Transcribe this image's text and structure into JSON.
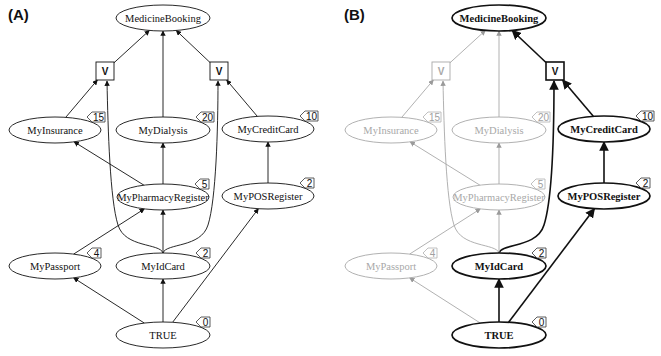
{
  "figure": {
    "panels": [
      {
        "label": "(A)",
        "highlight": []
      },
      {
        "label": "(B)",
        "highlight": [
          "MedicineBooking",
          "OR2",
          "MyCreditCard",
          "MyPOSRegister",
          "MyIdCard",
          "TRUE"
        ]
      }
    ],
    "nodes": [
      {
        "id": "MedicineBooking",
        "label": "MedicineBooking",
        "type": "ellipse",
        "cost": null
      },
      {
        "id": "OR1",
        "label": "V",
        "type": "or",
        "cost": null
      },
      {
        "id": "OR2",
        "label": "V",
        "type": "or",
        "cost": null
      },
      {
        "id": "MyInsurance",
        "label": "MyInsurance",
        "type": "ellipse",
        "cost": "15"
      },
      {
        "id": "MyDialysis",
        "label": "MyDialysis",
        "type": "ellipse",
        "cost": "20"
      },
      {
        "id": "MyCreditCard",
        "label": "MyCreditCard",
        "type": "ellipse",
        "cost": "10"
      },
      {
        "id": "MyPharmacyRegister",
        "label": "MyPharmacyRegister",
        "type": "ellipse",
        "cost": "5"
      },
      {
        "id": "MyPOSRegister",
        "label": "MyPOSRegister",
        "type": "ellipse",
        "cost": "2"
      },
      {
        "id": "MyPassport",
        "label": "MyPassport",
        "type": "ellipse",
        "cost": "4"
      },
      {
        "id": "MyIdCard",
        "label": "MyIdCard",
        "type": "ellipse",
        "cost": "2"
      },
      {
        "id": "TRUE",
        "label": "TRUE",
        "type": "ellipse",
        "cost": "0"
      }
    ],
    "edges": [
      {
        "from": "OR1",
        "to": "MedicineBooking"
      },
      {
        "from": "MyDialysis",
        "to": "MedicineBooking"
      },
      {
        "from": "OR2",
        "to": "MedicineBooking"
      },
      {
        "from": "MyInsurance",
        "to": "OR1"
      },
      {
        "from": "MyIdCard",
        "to": "OR1"
      },
      {
        "from": "MyCreditCard",
        "to": "OR2"
      },
      {
        "from": "MyIdCard",
        "to": "OR2"
      },
      {
        "from": "MyPharmacyRegister",
        "to": "MyInsurance"
      },
      {
        "from": "MyPharmacyRegister",
        "to": "MyDialysis"
      },
      {
        "from": "MyPOSRegister",
        "to": "MyCreditCard"
      },
      {
        "from": "MyPassport",
        "to": "MyPharmacyRegister"
      },
      {
        "from": "MyIdCard",
        "to": "MyPharmacyRegister"
      },
      {
        "from": "TRUE",
        "to": "MyPassport"
      },
      {
        "from": "TRUE",
        "to": "MyIdCard"
      },
      {
        "from": "TRUE",
        "to": "MyPOSRegister"
      }
    ]
  }
}
